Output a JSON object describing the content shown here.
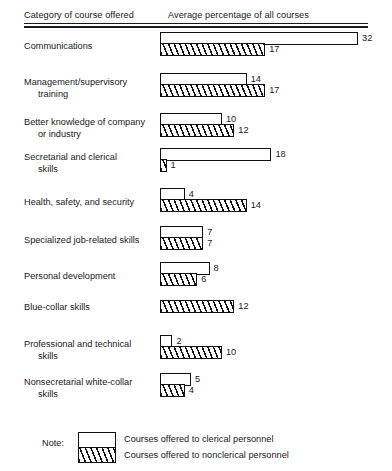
{
  "header": {
    "category_column": "Category of course offered",
    "value_column": "Average percentage of all courses"
  },
  "legend": {
    "note_label": "Note:",
    "clerical_text": "Courses offered to clerical personnel",
    "nonclerical_text": "Courses offered to nonclerical personnel"
  },
  "chart_data": {
    "type": "bar",
    "orientation": "horizontal",
    "title": "",
    "subtitle": "",
    "xlabel": "Average percentage of all courses",
    "ylabel": "Category of course offered",
    "xlim": [
      0,
      32
    ],
    "grid": false,
    "legend_position": "bottom",
    "categories": [
      "Communications",
      "Management/supervisory training",
      "Better knowledge of company or industry",
      "Secretarial and clerical skills",
      "Health, safety, and security",
      "Specialized job-related skills",
      "Personal development",
      "Blue-collar skills",
      "Professional and technical skills",
      "Nonsecretarial white-collar skills"
    ],
    "category_lines": [
      [
        "Communications"
      ],
      [
        "Management/supervisory",
        "training"
      ],
      [
        "Better knowledge of company",
        "or industry"
      ],
      [
        "Secretarial and clerical",
        "skills"
      ],
      [
        "Health, safety, and security"
      ],
      [
        "Specialized job-related skills"
      ],
      [
        "Personal development"
      ],
      [
        "Blue-collar skills"
      ],
      [
        "Professional and technical",
        "skills"
      ],
      [
        "Nonsecretarial white-collar",
        "skills"
      ]
    ],
    "series": [
      {
        "name": "Courses offered to clerical personnel",
        "pattern": "open",
        "values": [
          32,
          14,
          10,
          18,
          4,
          7,
          8,
          null,
          2,
          5
        ]
      },
      {
        "name": "Courses offered to nonclerical personnel",
        "pattern": "hatched",
        "values": [
          17,
          17,
          12,
          1,
          14,
          7,
          6,
          12,
          10,
          4
        ]
      }
    ]
  },
  "groups": [
    {
      "label_lines": [
        "Communications"
      ],
      "clerical": 32,
      "nonclerical": 17
    },
    {
      "label_lines": [
        "Management/supervisory",
        "training"
      ],
      "clerical": 14,
      "nonclerical": 17
    },
    {
      "label_lines": [
        "Better knowledge of company",
        "or industry"
      ],
      "clerical": 10,
      "nonclerical": 12
    },
    {
      "label_lines": [
        "Secretarial and clerical",
        "skills"
      ],
      "clerical": 18,
      "nonclerical": 1
    },
    {
      "label_lines": [
        "Health, safety, and security"
      ],
      "clerical": 4,
      "nonclerical": 14
    },
    {
      "label_lines": [
        "Specialized job-related skills"
      ],
      "clerical": 7,
      "nonclerical": 7
    },
    {
      "label_lines": [
        "Personal development"
      ],
      "clerical": 8,
      "nonclerical": 6
    },
    {
      "label_lines": [
        "Blue-collar skills"
      ],
      "clerical": null,
      "nonclerical": 12
    },
    {
      "label_lines": [
        "Professional and technical",
        "skills"
      ],
      "clerical": 2,
      "nonclerical": 10
    },
    {
      "label_lines": [
        "Nonsecretarial white-collar",
        "skills"
      ],
      "clerical": 5,
      "nonclerical": 4
    }
  ]
}
